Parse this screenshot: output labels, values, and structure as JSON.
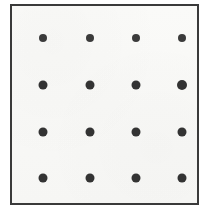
{
  "figure": {
    "name": "dot-grid-figure",
    "canvas": {
      "width": 210,
      "height": 213,
      "background": "#ffffff"
    },
    "panel": {
      "name": "bordered-square",
      "x": 10,
      "y": 4,
      "width": 189,
      "height": 201,
      "background": "#f8f8f6",
      "border_color": "#3a3a3a",
      "border_width": 2
    },
    "dot_style": {
      "color": "#333333",
      "shape": "circle",
      "diameter_row_0": 8,
      "diameter_other_rows": 9
    },
    "grid": {
      "rows": 4,
      "columns": 4,
      "count": 16,
      "column_centers_x": [
        31,
        78,
        124,
        170
      ],
      "row_centers_y": [
        32,
        79,
        126,
        172
      ],
      "column_spacing": 46,
      "row_spacing": 47
    },
    "dots": [
      {
        "id": "dot-r0-c0",
        "row": 0,
        "col": 0,
        "cx": 31,
        "cy": 32,
        "d": 8
      },
      {
        "id": "dot-r0-c1",
        "row": 0,
        "col": 1,
        "cx": 78,
        "cy": 32,
        "d": 8
      },
      {
        "id": "dot-r0-c2",
        "row": 0,
        "col": 2,
        "cx": 124,
        "cy": 32,
        "d": 8
      },
      {
        "id": "dot-r0-c3",
        "row": 0,
        "col": 3,
        "cx": 170,
        "cy": 32,
        "d": 8
      },
      {
        "id": "dot-r1-c0",
        "row": 1,
        "col": 0,
        "cx": 31,
        "cy": 79,
        "d": 9
      },
      {
        "id": "dot-r1-c1",
        "row": 1,
        "col": 1,
        "cx": 78,
        "cy": 79,
        "d": 9
      },
      {
        "id": "dot-r1-c2",
        "row": 1,
        "col": 2,
        "cx": 124,
        "cy": 79,
        "d": 9
      },
      {
        "id": "dot-r1-c3",
        "row": 1,
        "col": 3,
        "cx": 170,
        "cy": 79,
        "d": 10
      },
      {
        "id": "dot-r2-c0",
        "row": 2,
        "col": 0,
        "cx": 31,
        "cy": 126,
        "d": 9
      },
      {
        "id": "dot-r2-c1",
        "row": 2,
        "col": 1,
        "cx": 78,
        "cy": 126,
        "d": 9
      },
      {
        "id": "dot-r2-c2",
        "row": 2,
        "col": 2,
        "cx": 124,
        "cy": 126,
        "d": 9
      },
      {
        "id": "dot-r2-c3",
        "row": 2,
        "col": 3,
        "cx": 170,
        "cy": 126,
        "d": 9
      },
      {
        "id": "dot-r3-c0",
        "row": 3,
        "col": 0,
        "cx": 31,
        "cy": 172,
        "d": 9
      },
      {
        "id": "dot-r3-c1",
        "row": 3,
        "col": 1,
        "cx": 78,
        "cy": 172,
        "d": 9
      },
      {
        "id": "dot-r3-c2",
        "row": 3,
        "col": 2,
        "cx": 124,
        "cy": 172,
        "d": 9
      },
      {
        "id": "dot-r3-c3",
        "row": 3,
        "col": 3,
        "cx": 170,
        "cy": 172,
        "d": 9
      }
    ]
  }
}
